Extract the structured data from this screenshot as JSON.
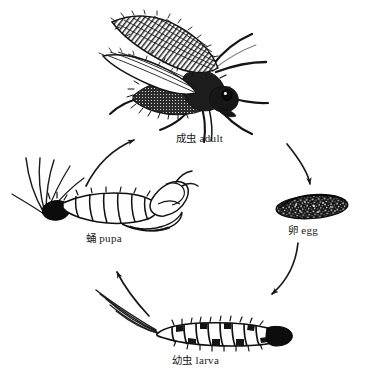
{
  "figure": {
    "background_color": "#ffffff",
    "ink_color": "#111111",
    "style": "black-and-white scientific line engraving",
    "cycle_direction": "clockwise"
  },
  "stages": [
    {
      "id": "adult",
      "label_cn": "成虫",
      "label_en": "adult",
      "position": "top",
      "icon": "adult-fly-icon"
    },
    {
      "id": "egg",
      "label_cn": "卵",
      "label_en": "egg",
      "position": "right",
      "icon": "egg-icon"
    },
    {
      "id": "larva",
      "label_cn": "幼虫",
      "label_en": "larva",
      "position": "bottom",
      "icon": "larva-icon"
    },
    {
      "id": "pupa",
      "label_cn": "蛹",
      "label_en": "pupa",
      "position": "left",
      "icon": "pupa-icon"
    }
  ],
  "arrows": [
    {
      "id": "adult-to-egg",
      "from": "adult",
      "to": "egg",
      "shape": "curved",
      "head": "down"
    },
    {
      "id": "egg-to-larva",
      "from": "egg",
      "to": "larva",
      "shape": "curved",
      "head": "down-left"
    },
    {
      "id": "larva-to-pupa",
      "from": "larva",
      "to": "pupa",
      "shape": "curved",
      "head": "up-left"
    },
    {
      "id": "pupa-to-adult",
      "from": "pupa",
      "to": "adult",
      "shape": "curved",
      "head": "up-right"
    }
  ]
}
